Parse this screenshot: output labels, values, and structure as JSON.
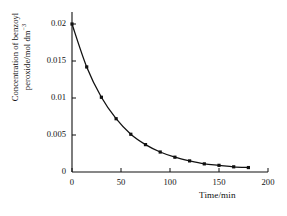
{
  "chart_data": {
    "type": "line",
    "title": "",
    "xlabel": "Time/min",
    "ylabel_line1": "Concentration of benzoyl",
    "ylabel_line2": "peroxide/mol dm",
    "ylabel_exponent": "−3",
    "xlim": [
      0,
      200
    ],
    "ylim": [
      0,
      0.02
    ],
    "xticks": [
      0,
      50,
      100,
      150,
      200
    ],
    "xtick_labels": [
      "0",
      "50",
      "100",
      "150",
      "200"
    ],
    "yticks": [
      0,
      0.005,
      0.01,
      0.015,
      0.02
    ],
    "ytick_labels": [
      "0",
      "0.005",
      "0.01",
      "0.015",
      "0.02"
    ],
    "grid": false,
    "legend": false,
    "marker": "square",
    "line_color": "#111111",
    "marker_color": "#111111",
    "axis_color": "#111111",
    "background": "#ffffff",
    "x": [
      0,
      15,
      30,
      45,
      60,
      75,
      90,
      105,
      120,
      135,
      150,
      165,
      180
    ],
    "y": [
      0.02,
      0.0142,
      0.0101,
      0.0072,
      0.0051,
      0.0037,
      0.0027,
      0.002,
      0.0015,
      0.0011,
      0.0009,
      0.0007,
      0.0006
    ],
    "series": [
      {
        "name": "benzoyl peroxide decay",
        "points": [
          {
            "x": 0,
            "y": 0.02
          },
          {
            "x": 15,
            "y": 0.0142
          },
          {
            "x": 30,
            "y": 0.0101
          },
          {
            "x": 45,
            "y": 0.0072
          },
          {
            "x": 60,
            "y": 0.0051
          },
          {
            "x": 75,
            "y": 0.0037
          },
          {
            "x": 90,
            "y": 0.0027
          },
          {
            "x": 105,
            "y": 0.002
          },
          {
            "x": 120,
            "y": 0.0015
          },
          {
            "x": 135,
            "y": 0.0011
          },
          {
            "x": 150,
            "y": 0.0009
          },
          {
            "x": 165,
            "y": 0.0007
          },
          {
            "x": 180,
            "y": 0.0006
          }
        ]
      }
    ]
  }
}
